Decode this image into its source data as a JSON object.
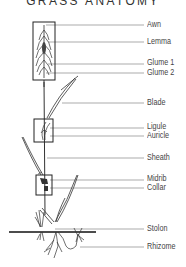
{
  "diagram": {
    "title": "GRASS ANATOMY",
    "labels": [
      {
        "text": "Awn",
        "y": 25
      },
      {
        "text": "Lemma",
        "y": 42
      },
      {
        "text": "Glume 1",
        "y": 63
      },
      {
        "text": "Glume 2",
        "y": 73
      },
      {
        "text": "Blade",
        "y": 103
      },
      {
        "text": "Ligule",
        "y": 127
      },
      {
        "text": "Auricle",
        "y": 136
      },
      {
        "text": "Sheath",
        "y": 158
      },
      {
        "text": "Midrib",
        "y": 179
      },
      {
        "text": "Collar",
        "y": 187
      },
      {
        "text": "Stolon",
        "y": 229
      },
      {
        "text": "Rhizome",
        "y": 247
      }
    ],
    "colors": {
      "line": "#555555",
      "label": "#444444",
      "ink": "#222222"
    }
  }
}
